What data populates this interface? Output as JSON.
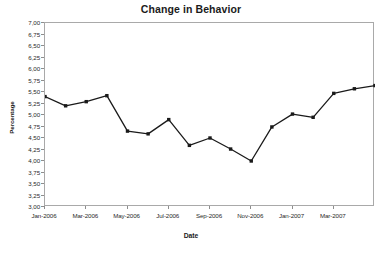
{
  "chart_data": {
    "type": "line",
    "title": "Change in Behavior",
    "xlabel": "Date",
    "ylabel": "Percentage",
    "grid": false,
    "legend": "none",
    "decimal_separator": ",",
    "x": [
      "Jan-2006",
      "Feb-2006",
      "Mar-2006",
      "Apr-2006",
      "May-2006",
      "Jun-2006",
      "Jul-2006",
      "Aug-2006",
      "Sep-2006",
      "Oct-2006",
      "Nov-2006",
      "Dec-2006",
      "Jan-2007",
      "Feb-2007",
      "Mar-2007",
      "Apr-2007",
      "May-2007"
    ],
    "values": [
      5.4,
      5.2,
      5.29,
      5.42,
      4.65,
      4.59,
      4.9,
      4.34,
      4.5,
      4.26,
      4.0,
      4.74,
      5.02,
      4.95,
      5.47,
      5.57,
      5.64
    ],
    "xlim_labels": [
      "Jan-2006",
      "May-2007"
    ],
    "ylim": [
      3.0,
      7.0
    ],
    "ytick_step": 0.25,
    "xtick_labels": [
      "Jan-2006",
      "Mar-2006",
      "May-2006",
      "Jul-2006",
      "Sep-2006",
      "Nov-2006",
      "Jan-2007",
      "Mar-2007"
    ],
    "xtick_indices": [
      0,
      2,
      4,
      6,
      8,
      10,
      12,
      14
    ],
    "ytick_labels": [
      "7,00",
      "6,75",
      "6,50",
      "6,25",
      "6,00",
      "5,75",
      "5,50",
      "5,25",
      "5,00",
      "4,75",
      "4,50",
      "4,25",
      "4,00",
      "3,75",
      "3,50",
      "3,25",
      "3,00"
    ],
    "ytick_values": [
      7.0,
      6.75,
      6.5,
      6.25,
      6.0,
      5.75,
      5.5,
      5.25,
      5.0,
      4.75,
      4.5,
      4.25,
      4.0,
      3.75,
      3.5,
      3.25,
      3.0
    ],
    "series_color": "#1a1a1a",
    "marker": "square",
    "marker_size": 3.4,
    "line_width": 1.3,
    "frame_color": "#a9a9a9"
  }
}
